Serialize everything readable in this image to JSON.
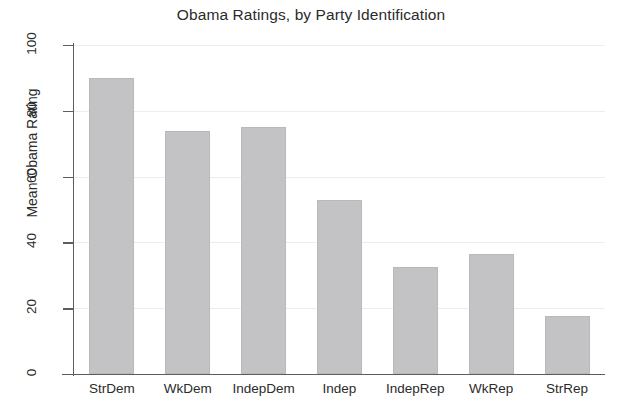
{
  "chart_data": {
    "type": "bar",
    "title": "Obama Ratings, by Party Identification",
    "xlabel": "",
    "ylabel": "Mean Obama Rating",
    "categories": [
      "StrDem",
      "WkDem",
      "IndepDem",
      "Indep",
      "IndepRep",
      "WkRep",
      "StrRep"
    ],
    "values": [
      90,
      74,
      75,
      53,
      32.5,
      36.5,
      17.5
    ],
    "ylim": [
      0,
      100
    ],
    "yticks": [
      0,
      20,
      40,
      60,
      80,
      100
    ],
    "ytick_labels": [
      "0",
      "20",
      "40",
      "60",
      "80",
      "100"
    ],
    "grid": "horizontal",
    "legend": "none",
    "bar_color": "#c3c3c5",
    "grid_color": "#ededed",
    "axis_color": "#5d5d5d",
    "background": "#ffffff"
  }
}
